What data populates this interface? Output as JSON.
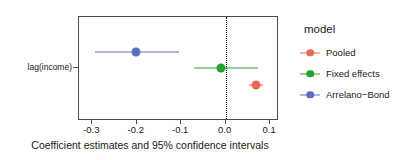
{
  "chart_data": {
    "type": "scatter",
    "title": "",
    "xlabel": "Coefficient estimates and 95% confidence intervals",
    "ylabel": "",
    "xlim": [
      -0.33,
      0.12
    ],
    "xticks": [
      -0.3,
      -0.2,
      -0.1,
      0.0,
      0.1
    ],
    "xtick_labels": [
      "-0.3",
      "-0.2",
      "-0.1",
      "0.0",
      "0.1"
    ],
    "ycategories": [
      "lag(income)"
    ],
    "grid": false,
    "reference_line": 0.0,
    "legend_position": "right",
    "legend_title": "model",
    "series": [
      {
        "name": "Pooled",
        "color": "#e8685a",
        "estimate": 0.07,
        "conf_low": 0.055,
        "conf_high": 0.086,
        "category": "lag(income)"
      },
      {
        "name": "Fixed effects",
        "color": "#2ca02c",
        "estimate": -0.008,
        "conf_low": -0.068,
        "conf_high": 0.074,
        "category": "lag(income)"
      },
      {
        "name": "Arrelano−Bond",
        "color": "#5a6fbf",
        "estimate": -0.199,
        "conf_low": -0.292,
        "conf_high": -0.102,
        "category": "lag(income)"
      }
    ]
  },
  "axes": {
    "y_category_label": "lag(income)",
    "x_title": "Coefficient estimates and 95% confidence intervals",
    "x_tick_labels": [
      "-0.3",
      "-0.2",
      "-0.1",
      "0.0",
      "0.1"
    ]
  },
  "legend": {
    "title": "model",
    "items": [
      {
        "label": "Pooled",
        "color": "#e8685a"
      },
      {
        "label": "Fixed effects",
        "color": "#2ca02c"
      },
      {
        "label": "Arrelano−Bond",
        "color": "#5a6fbf"
      }
    ]
  }
}
